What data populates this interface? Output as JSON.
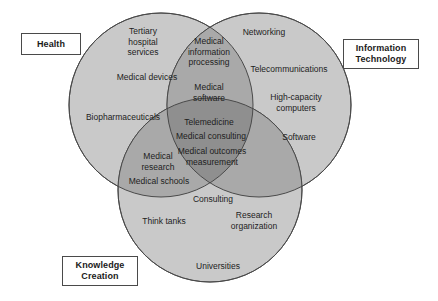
{
  "diagram": {
    "type": "venn-3-circle",
    "title": "",
    "background_color": "#ffffff",
    "circle_fill": "#c9c9c9",
    "circle_stroke": "#4a4a4a",
    "overlap_shade_color": "#a8a8a8",
    "center_shade_color": "#8f8f8f",
    "text_color": "#1d1d1d"
  },
  "set_labels": {
    "health": "Health",
    "information_technology": "Information\nTechnology",
    "knowledge_creation": "Knowledge\nCreation"
  },
  "regions": {
    "health_only": [
      {
        "text": "Tertiary\nhospital\nservices"
      },
      {
        "text": "Medical devices"
      },
      {
        "text": "Biopharmaceuticals"
      }
    ],
    "it_only": [
      {
        "text": "Networking"
      },
      {
        "text": "Telecommunications"
      },
      {
        "text": "High-capacity\ncomputers"
      },
      {
        "text": "Software"
      }
    ],
    "knowledge_only": [
      {
        "text": "Think tanks"
      },
      {
        "text": "Research\norganization"
      },
      {
        "text": "Universities"
      }
    ],
    "health_it": [
      {
        "text": "Medical\ninformation\nprocessing"
      },
      {
        "text": "Medical\nsoftware"
      }
    ],
    "health_knowledge": [
      {
        "text": "Medical\nresearch"
      },
      {
        "text": "Medical schools"
      }
    ],
    "it_knowledge": [
      {
        "text": "Consulting"
      }
    ],
    "all_three": [
      {
        "text": "Telemedicine"
      },
      {
        "text": "Medical consulting"
      },
      {
        "text": "Medical outcomes\nmeasurement"
      }
    ]
  }
}
